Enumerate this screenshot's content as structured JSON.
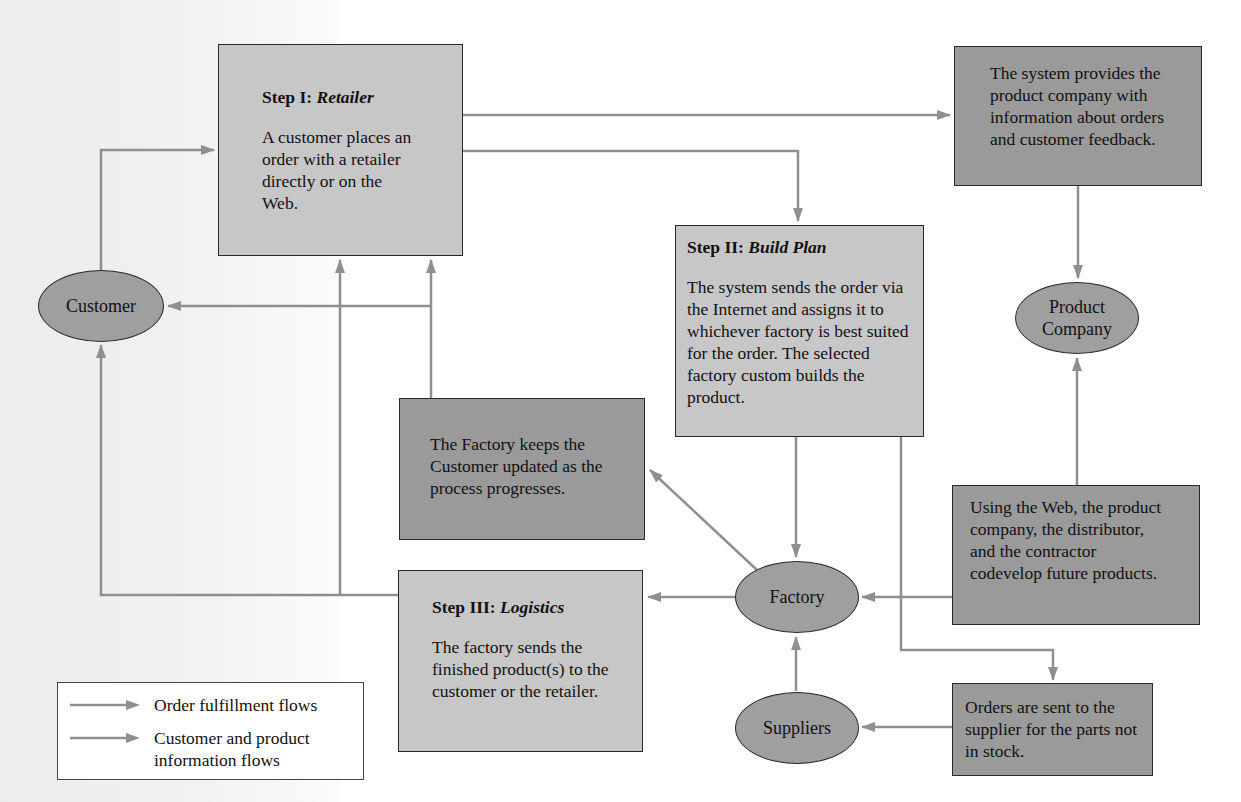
{
  "diagram": {
    "colors": {
      "arrow": "#8f8f8f",
      "light_box": "#c7c7c7",
      "dark_box": "#9a9a9a",
      "ellipse": "#9f9f9f"
    },
    "step1": {
      "prefix": "Step I: ",
      "name": "Retailer",
      "text": "A customer places an order with a retailer directly or on the Web."
    },
    "step2": {
      "prefix": "Step II: ",
      "name": "Build Plan",
      "text": "The system sends the order via the Internet and assigns it to whichever factory is best suited for the order. The selected factory custom builds the product."
    },
    "step3": {
      "prefix": "Step III: ",
      "name": "Logistics",
      "text": "The factory sends the finished product(s) to the customer or the retailer."
    },
    "info_system": {
      "text": "The system provides the product company with information about orders and customer feedback."
    },
    "info_factory": {
      "text": "The Factory keeps the Customer updated as the process progresses."
    },
    "info_codevelop": {
      "text": "Using the Web, the product company, the distributor, and the contractor codevelop future products."
    },
    "info_orders": {
      "text": "Orders are sent to the supplier for the parts not in stock."
    },
    "nodes": {
      "customer": "Customer",
      "product_company": "Product Company",
      "factory": "Factory",
      "suppliers": "Suppliers"
    },
    "legend": [
      {
        "label": "Order fulfillment flows"
      },
      {
        "label": "Customer and product information flows"
      }
    ]
  }
}
